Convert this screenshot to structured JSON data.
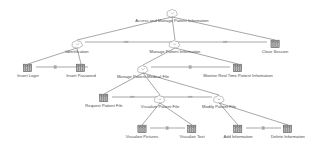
{
  "diagram": {
    "type": "task-tree",
    "notation": "ConcurTaskTrees",
    "title": "Access and Manage Patient Information",
    "colors": {
      "edge": "#6b6b6b",
      "label": "#4a4a4a",
      "operator": "#555555",
      "abstract_node": "#8d8d8d",
      "interaction_node": "#5a5a5a",
      "background": "#ffffff"
    },
    "icon_names": {
      "abstract": "cloud-abstract-task-icon",
      "interaction": "hatched-interaction-task-icon"
    },
    "levels": [
      {
        "level": 0,
        "nodes": [
          {
            "id": "root",
            "label": "Access and Manage Patient Information",
            "kind": "abstract",
            "x": 172,
            "y": 8
          }
        ],
        "operators": []
      },
      {
        "level": 1,
        "nodes": [
          {
            "id": "identification",
            "label": "Identification",
            "kind": "abstract",
            "x": 77,
            "y": 39
          },
          {
            "id": "manage-patient-information",
            "label": "Manage Patient Information",
            "kind": "abstract",
            "x": 175,
            "y": 39
          },
          {
            "id": "close-session",
            "label": "Close Session",
            "kind": "interaction",
            "x": 275,
            "y": 39
          }
        ],
        "operators": [
          {
            "id": "op-l1-a",
            "symbol": ">>",
            "x": 126,
            "y": 42
          },
          {
            "id": "op-l1-b",
            "symbol": ">>",
            "x": 225,
            "y": 42
          }
        ]
      },
      {
        "level": 2,
        "nodes": [
          {
            "id": "insert-login",
            "label": "Insert Login",
            "kind": "interaction",
            "x": 28,
            "y": 63
          },
          {
            "id": "insert-password",
            "label": "Insert Password",
            "kind": "interaction",
            "x": 81,
            "y": 63
          },
          {
            "id": "manage-patient-medical-file",
            "label": "Manage Patient Medical File",
            "kind": "abstract",
            "x": 143,
            "y": 64
          },
          {
            "id": "monitor-real-time-patient-information",
            "label": "Monitor Real Time Patient Information",
            "kind": "interaction",
            "x": 238,
            "y": 63
          }
        ],
        "operators": [
          {
            "id": "op-l2-a",
            "symbol": "|||",
            "x": 55,
            "y": 67
          },
          {
            "id": "op-l2-b",
            "symbol": "|||",
            "x": 190,
            "y": 67
          }
        ]
      },
      {
        "level": 3,
        "nodes": [
          {
            "id": "request-patient-file",
            "label": "Request Patient File",
            "kind": "interaction",
            "x": 104,
            "y": 93
          },
          {
            "id": "visualize-patient-file",
            "label": "Visualize Patient File",
            "kind": "abstract",
            "x": 160,
            "y": 94
          },
          {
            "id": "modify-patient-file",
            "label": "Modify Patient File",
            "kind": "abstract",
            "x": 219,
            "y": 94
          }
        ],
        "operators": [
          {
            "id": "op-l3-a",
            "symbol": ">>",
            "x": 132,
            "y": 97
          },
          {
            "id": "op-l3-b",
            "symbol": ">>",
            "x": 190,
            "y": 97
          }
        ]
      },
      {
        "level": 4,
        "nodes": [
          {
            "id": "visualize-pictures",
            "label": "Visualize Pictures",
            "kind": "interaction",
            "x": 142,
            "y": 124
          },
          {
            "id": "visualize-text",
            "label": "Visualize Text",
            "kind": "interaction",
            "x": 192,
            "y": 124
          },
          {
            "id": "add-information",
            "label": "Add Information",
            "kind": "interaction",
            "x": 238,
            "y": 124
          },
          {
            "id": "delete-information",
            "label": "Delete Information",
            "kind": "interaction",
            "x": 288,
            "y": 124
          }
        ],
        "operators": [
          {
            "id": "op-l4-a",
            "symbol": "|||",
            "x": 167,
            "y": 128
          },
          {
            "id": "op-l4-b",
            "symbol": "|||",
            "x": 263,
            "y": 128
          }
        ]
      }
    ],
    "edges": [
      {
        "id": "edge-root-identification",
        "from": "root",
        "to": "identification"
      },
      {
        "id": "edge-root-manage",
        "from": "root",
        "to": "manage-patient-information"
      },
      {
        "id": "edge-root-close",
        "from": "root",
        "to": "close-session"
      },
      {
        "id": "edge-identification-login",
        "from": "identification",
        "to": "insert-login"
      },
      {
        "id": "edge-identification-password",
        "from": "identification",
        "to": "insert-password"
      },
      {
        "id": "edge-manage-medicalfile",
        "from": "manage-patient-information",
        "to": "manage-patient-medical-file"
      },
      {
        "id": "edge-manage-monitor",
        "from": "manage-patient-information",
        "to": "monitor-real-time-patient-information"
      },
      {
        "id": "edge-medicalfile-request",
        "from": "manage-patient-medical-file",
        "to": "request-patient-file"
      },
      {
        "id": "edge-medicalfile-visualize",
        "from": "manage-patient-medical-file",
        "to": "visualize-patient-file"
      },
      {
        "id": "edge-medicalfile-modify",
        "from": "manage-patient-medical-file",
        "to": "modify-patient-file"
      },
      {
        "id": "edge-visualize-pictures",
        "from": "visualize-patient-file",
        "to": "visualize-pictures"
      },
      {
        "id": "edge-visualize-text",
        "from": "visualize-patient-file",
        "to": "visualize-text"
      },
      {
        "id": "edge-modify-add",
        "from": "modify-patient-file",
        "to": "add-information"
      },
      {
        "id": "edge-modify-delete",
        "from": "modify-patient-file",
        "to": "delete-information"
      }
    ],
    "connector_lines": [
      {
        "id": "conn-l1",
        "x1": 85,
        "x2": 267,
        "y": 42
      },
      {
        "id": "conn-l2",
        "x1": 36,
        "x2": 88,
        "y": 67
      },
      {
        "id": "conn-l2b",
        "x1": 151,
        "x2": 230,
        "y": 67
      },
      {
        "id": "conn-l3",
        "x1": 112,
        "x2": 212,
        "y": 97
      },
      {
        "id": "conn-l4a",
        "x1": 150,
        "x2": 185,
        "y": 128
      },
      {
        "id": "conn-l4b",
        "x1": 246,
        "x2": 281,
        "y": 128
      }
    ]
  }
}
